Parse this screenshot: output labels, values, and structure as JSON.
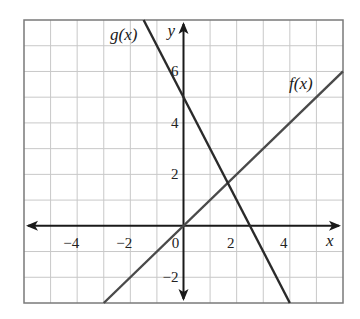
{
  "chart_data": {
    "type": "line",
    "title": "",
    "xlabel": "x",
    "ylabel": "y",
    "xlim": [
      -6,
      6
    ],
    "ylim": [
      -3,
      8
    ],
    "grid": true,
    "x_ticks": [
      {
        "value": -4,
        "label": "−4"
      },
      {
        "value": -2,
        "label": "−2"
      },
      {
        "value": 0,
        "label": "0"
      },
      {
        "value": 2,
        "label": "2"
      },
      {
        "value": 4,
        "label": "4"
      }
    ],
    "y_ticks": [
      {
        "value": 6,
        "label": "6"
      },
      {
        "value": 4,
        "label": "4"
      },
      {
        "value": 2,
        "label": "2"
      },
      {
        "value": -2,
        "label": "−2"
      }
    ],
    "series": [
      {
        "name": "f(x)",
        "label": "f(x)",
        "equation": "y = x",
        "slope": 1,
        "intercept": 0,
        "color": "#4a4a4a",
        "points": [
          [
            -3,
            -3
          ],
          [
            6,
            6
          ]
        ]
      },
      {
        "name": "g(x)",
        "label": "g(x)",
        "equation": "y = -2x + 5",
        "slope": -2,
        "intercept": 5,
        "color": "#2a2a2a",
        "points": [
          [
            -1.5,
            8
          ],
          [
            4,
            -3
          ]
        ]
      }
    ],
    "annotations": [
      {
        "text": "g(x)",
        "x": -3.2,
        "y": 7.4
      },
      {
        "text": "f(x)",
        "x": 4.8,
        "y": 6.3
      }
    ],
    "intersection": [
      1.67,
      1.67
    ]
  }
}
